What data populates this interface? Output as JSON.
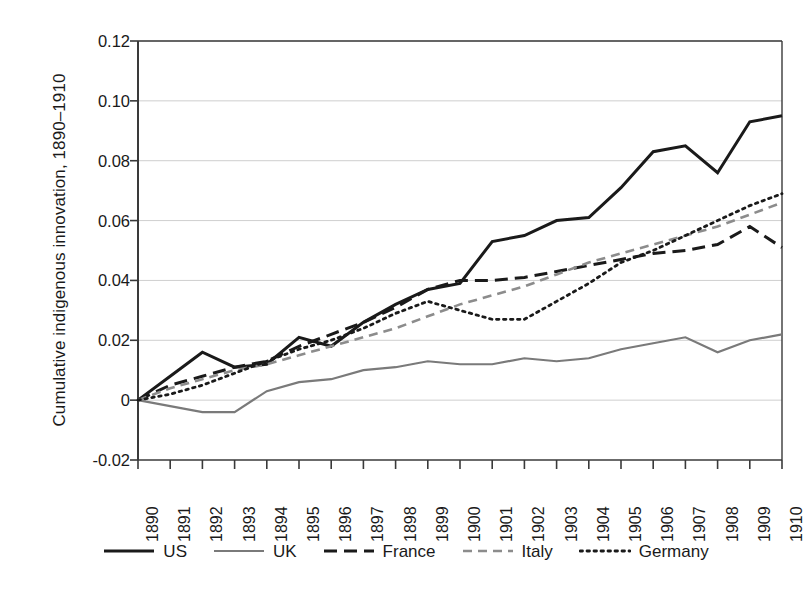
{
  "chart_data": {
    "type": "line",
    "title": "",
    "xlabel": "",
    "ylabel": "Cumulative indigenous innovation, 1890–1910",
    "x": [
      1890,
      1891,
      1892,
      1893,
      1894,
      1895,
      1896,
      1897,
      1898,
      1899,
      1900,
      1901,
      1902,
      1903,
      1904,
      1905,
      1906,
      1907,
      1908,
      1909,
      1910
    ],
    "xtick_labels": [
      "1890",
      "1891",
      "1892",
      "1893",
      "1894",
      "1895",
      "1896",
      "1897",
      "1898",
      "1899",
      "1900",
      "1901",
      "1902",
      "1903",
      "1904",
      "1905",
      "1906",
      "1907",
      "1908",
      "1909",
      "1910"
    ],
    "ytick_labels": [
      "0.12",
      "0.10",
      "0.08",
      "0.06",
      "0.04",
      "0.02",
      "0",
      "-0.02"
    ],
    "ytick_values": [
      0.12,
      0.1,
      0.08,
      0.06,
      0.04,
      0.02,
      0,
      -0.02
    ],
    "xlim": [
      1890,
      1910
    ],
    "ylim": [
      -0.02,
      0.12
    ],
    "grid": true,
    "legend_position": "bottom",
    "series": [
      {
        "name": "US",
        "color": "#1a1a1a",
        "style": "solid",
        "width": 3.0,
        "values": [
          0.0,
          0.008,
          0.016,
          0.011,
          0.012,
          0.021,
          0.018,
          0.026,
          0.032,
          0.037,
          0.039,
          0.053,
          0.055,
          0.06,
          0.061,
          0.071,
          0.083,
          0.085,
          0.076,
          0.093,
          0.095
        ]
      },
      {
        "name": "UK",
        "color": "#7a7a7a",
        "style": "solid",
        "width": 2.2,
        "values": [
          0.0,
          -0.002,
          -0.004,
          -0.004,
          0.003,
          0.006,
          0.007,
          0.01,
          0.011,
          0.013,
          0.012,
          0.012,
          0.014,
          0.013,
          0.014,
          0.017,
          0.019,
          0.021,
          0.016,
          0.02,
          0.022
        ]
      },
      {
        "name": "France",
        "color": "#1a1a1a",
        "style": "dashed",
        "width": 3.0,
        "values": [
          0.0,
          0.005,
          0.008,
          0.011,
          0.013,
          0.018,
          0.022,
          0.026,
          0.031,
          0.037,
          0.04,
          0.04,
          0.041,
          0.043,
          0.045,
          0.047,
          0.049,
          0.05,
          0.052,
          0.058,
          0.051
        ]
      },
      {
        "name": "Italy",
        "color": "#8c8c8c",
        "style": "dashed",
        "width": 2.6,
        "values": [
          0.0,
          0.004,
          0.007,
          0.01,
          0.012,
          0.015,
          0.018,
          0.021,
          0.024,
          0.028,
          0.032,
          0.035,
          0.038,
          0.042,
          0.046,
          0.049,
          0.052,
          0.055,
          0.058,
          0.062,
          0.066
        ]
      },
      {
        "name": "Germany",
        "color": "#1a1a1a",
        "style": "dotted",
        "width": 2.8,
        "values": [
          0.0,
          0.002,
          0.005,
          0.009,
          0.013,
          0.017,
          0.02,
          0.024,
          0.029,
          0.033,
          0.03,
          0.027,
          0.027,
          0.033,
          0.039,
          0.046,
          0.05,
          0.055,
          0.06,
          0.065,
          0.069
        ]
      }
    ]
  }
}
